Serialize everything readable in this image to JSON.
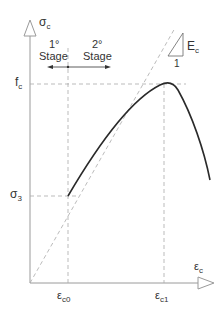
{
  "diagram": {
    "type": "stress-strain curve (concrete)",
    "y_axis": {
      "label": "σ",
      "sub": "c"
    },
    "x_axis": {
      "label": "ε",
      "sub": "c"
    },
    "y_ticks": [
      {
        "label": "f",
        "sub": "c"
      },
      {
        "label": "σ",
        "sub": "3"
      }
    ],
    "x_ticks": [
      {
        "label": "ε",
        "sub": "c0"
      },
      {
        "label": "ε",
        "sub": "c1"
      }
    ],
    "stages": [
      {
        "number": "1°",
        "label": "Stage"
      },
      {
        "number": "2°",
        "label": "Stage"
      }
    ],
    "slope": {
      "label": "E",
      "sub": "c",
      "run": "1"
    },
    "colors": {
      "curve": "#2a2a2a",
      "axis": "#9a9a9a",
      "dashed": "#aaaaaa"
    }
  }
}
